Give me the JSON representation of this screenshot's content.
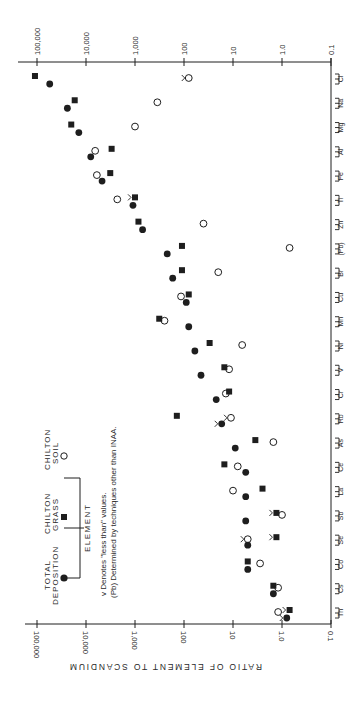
{
  "chart_data": {
    "type": "scatter",
    "orientation": "rotated-90-clockwise",
    "title": "",
    "xlabel": "ELEMENT",
    "ylabel": "RATIO OF ELEMENT TO SCANDIUM",
    "yscale": "log",
    "ylim": [
      0.1,
      100000
    ],
    "tick_labels": [
      "100,000",
      "10,000",
      "1,000",
      "100",
      "10",
      "1.0",
      "0.1"
    ],
    "tick_values": [
      100000,
      10000,
      1000,
      100,
      10,
      1.0,
      0.1
    ],
    "grid": false,
    "categories": [
      "Cl",
      "Na",
      "Mg",
      "Al",
      "Fe",
      "Ti",
      "Zn",
      "(Pb)",
      "Br",
      "Cu",
      "Mn",
      "Ni",
      "V",
      "Cr",
      "Rb",
      "As",
      "Ce",
      "La",
      "Sb",
      "Se",
      "Co",
      "Cs",
      "Th"
    ],
    "series": [
      {
        "name": "Total Deposition",
        "marker": "filled-circle",
        "values": [
          55000,
          24000,
          14000,
          8000,
          4700,
          1100,
          700,
          220,
          170,
          90,
          80,
          60,
          45,
          22,
          17,
          9,
          5.5,
          5.5,
          5.5,
          5.0,
          5.0,
          1.5,
          0.8
        ],
        "less_than": [
          "Rb",
          "Th"
        ]
      },
      {
        "name": "Chilton Grass",
        "marker": "filled-square",
        "values": [
          110000,
          17000,
          20000,
          3000,
          3200,
          1000,
          850,
          110,
          110,
          80,
          320,
          30,
          15,
          12,
          140,
          3.5,
          15,
          2.5,
          1.3,
          1.3,
          5.0,
          1.5,
          0.7
        ],
        "less_than": [
          "Ti",
          "Sb",
          "Se",
          "Th"
        ]
      },
      {
        "name": "Chilton Soil",
        "marker": "open-circle",
        "values": [
          80,
          350,
          1000,
          6500,
          6000,
          2300,
          40,
          0.7,
          20,
          115,
          250,
          6.5,
          12,
          14,
          11,
          1.5,
          8,
          10,
          1.0,
          5.0,
          2.8,
          1.2,
          1.2
        ],
        "less_than": [
          "Cl",
          "Rb",
          "Se"
        ]
      }
    ],
    "legend": {
      "position": "lower-left (rotated)",
      "entries": [
        "TOTAL DEPOSITION",
        "CHILTON GRASS",
        "CHILTON SOIL"
      ],
      "axis_group_label": "ELEMENT"
    },
    "annotations": [
      "v Denotes \"less than\" values.",
      "(Pb) Determined by techniques other than INAA."
    ]
  },
  "legend": {
    "total_l1": "TOTAL",
    "total_l2": "DEPOSITION",
    "grass_l1": "CHILTON",
    "grass_l2": "GRASS",
    "soil_l1": "CHILTON",
    "soil_l2": "SOIL",
    "element_label": "ELEMENT"
  },
  "notes": {
    "line1": "v  Denotes \"less than\" values.",
    "line2": "(Pb) Determined by techniques other than INAA."
  },
  "axis": {
    "ylabel": "RATIO OF ELEMENT TO SCANDIUM"
  },
  "colors": {
    "ink": "#1e1e1e",
    "background": "#ffffff"
  }
}
